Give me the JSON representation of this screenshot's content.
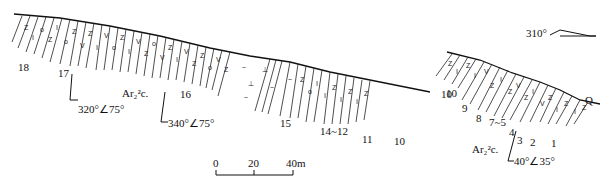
{
  "figure": {
    "type": "geological cross-section",
    "direction": "310°",
    "formation_label": "Ar₂²c.",
    "formation_label_right": "Ar₂²c.",
    "cover_label": "Q"
  },
  "left_section": {
    "layer_labels": [
      {
        "id": "18",
        "text": "18"
      },
      {
        "id": "17",
        "text": "17"
      },
      {
        "id": "16",
        "text": "16"
      },
      {
        "id": "15",
        "text": "15"
      },
      {
        "id": "14-12",
        "text": "14~12"
      },
      {
        "id": "11",
        "text": "11"
      },
      {
        "id": "10a",
        "text": "10"
      },
      {
        "id": "10b",
        "text": "10"
      }
    ],
    "attitudes": [
      {
        "text": "320°∠75°"
      },
      {
        "text": "340°∠75°"
      }
    ]
  },
  "right_section": {
    "layer_labels": [
      {
        "id": "10",
        "text": "10"
      },
      {
        "id": "9",
        "text": "9"
      },
      {
        "id": "8",
        "text": "8"
      },
      {
        "id": "7-5",
        "text": "7~5"
      },
      {
        "id": "4",
        "text": "4"
      },
      {
        "id": "3",
        "text": "3"
      },
      {
        "id": "2",
        "text": "2"
      },
      {
        "id": "1",
        "text": "1"
      }
    ],
    "attitudes": [
      {
        "text": "40°∠35°"
      }
    ]
  },
  "scale_bar": {
    "ticks": [
      "0",
      "20",
      "40m"
    ]
  }
}
